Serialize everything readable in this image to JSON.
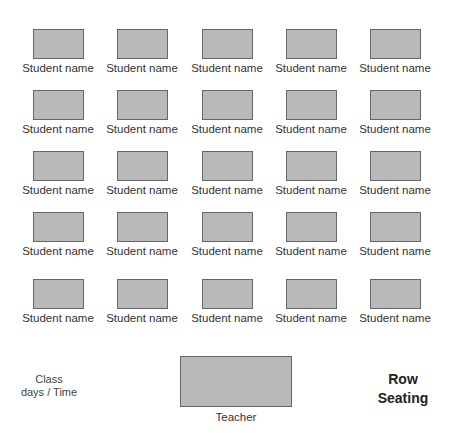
{
  "seating_chart": {
    "title_line1": "Row",
    "title_line2": "Seating",
    "class_info_line1": "Class",
    "class_info_line2": "days / Time",
    "teacher_label": "Teacher",
    "desk_color": "#b9b9b9",
    "rows": [
      [
        "Student name",
        "Student name",
        "Student name",
        "Student name",
        "Student name"
      ],
      [
        "Student name",
        "Student name",
        "Student name",
        "Student name",
        "Student name"
      ],
      [
        "Student name",
        "Student name",
        "Student name",
        "Student name",
        "Student name"
      ],
      [
        "Student name",
        "Student name",
        "Student name",
        "Student name",
        "Student name"
      ],
      [
        "Student name",
        "Student name",
        "Student name",
        "Student name",
        "Student name"
      ]
    ]
  }
}
